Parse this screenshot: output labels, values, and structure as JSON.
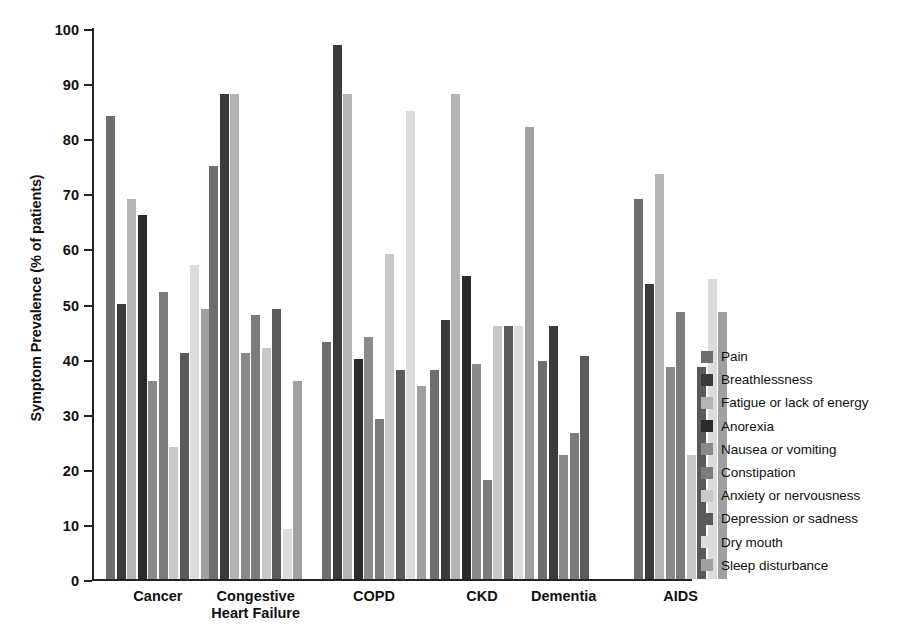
{
  "chart_data": {
    "type": "bar",
    "title": "",
    "xlabel": "",
    "ylabel": "Symptom Prevalence (% of patients)",
    "ylim": [
      0,
      100
    ],
    "yticks": [
      0,
      10,
      20,
      30,
      40,
      50,
      60,
      70,
      80,
      90,
      100
    ],
    "grid": false,
    "legend_position": "right",
    "categories": [
      "Cancer",
      "Congestive\nHeart Failure",
      "COPD",
      "CKD",
      "Dementia",
      "AIDS"
    ],
    "series": [
      {
        "name": "Pain",
        "color": "#6e6e6e",
        "values": [
          84,
          75,
          43,
          38,
          39.5,
          69
        ]
      },
      {
        "name": "Breathlessness",
        "color": "#3b3b3b",
        "values": [
          50,
          88,
          97,
          47,
          46,
          53.5
        ]
      },
      {
        "name": "Fatigue or lack of energy",
        "color": "#b4b4b4",
        "values": [
          69,
          88,
          88,
          88,
          null,
          73.5
        ]
      },
      {
        "name": "Anorexia",
        "color": "#2a2a2a",
        "values": [
          66,
          null,
          40,
          55,
          null,
          null
        ]
      },
      {
        "name": "Nausea or vomiting",
        "color": "#8a8a8a",
        "values": [
          36,
          41,
          44,
          39,
          22.5,
          38.5
        ]
      },
      {
        "name": "Constipation",
        "color": "#7c7c7c",
        "values": [
          52,
          48,
          29,
          18,
          26.5,
          48.5
        ]
      },
      {
        "name": "Anxiety or nervousness",
        "color": "#c8c8c8",
        "values": [
          24,
          42,
          59,
          46,
          null,
          22.5
        ]
      },
      {
        "name": "Depression or sadness",
        "color": "#5a5a5a",
        "values": [
          41,
          49,
          38,
          46,
          40.5,
          38.5
        ]
      },
      {
        "name": "Dry mouth",
        "color": "#dcdcdc",
        "values": [
          57,
          9,
          85,
          46,
          null,
          54.5
        ]
      },
      {
        "name": "Sleep disturbance",
        "color": "#a0a0a0",
        "values": [
          49,
          36,
          35,
          82,
          null,
          48.5
        ]
      }
    ]
  },
  "axis": {
    "tick_labels": [
      "0",
      "10",
      "20",
      "30",
      "40",
      "50",
      "60",
      "70",
      "80",
      "90",
      "100"
    ],
    "y_title": "Symptom Prevalence (% of patients)"
  },
  "groups": [
    {
      "label": "Cancer"
    },
    {
      "label": "Congestive\nHeart Failure"
    },
    {
      "label": "COPD"
    },
    {
      "label": "CKD"
    },
    {
      "label": "Dementia"
    },
    {
      "label": "AIDS"
    }
  ],
  "legend": {
    "items": [
      {
        "label": "Pain",
        "color": "#6e6e6e"
      },
      {
        "label": "Breathlessness",
        "color": "#3b3b3b"
      },
      {
        "label": "Fatigue or lack of energy",
        "color": "#b4b4b4"
      },
      {
        "label": "Anorexia",
        "color": "#2a2a2a"
      },
      {
        "label": "Nausea or vomiting",
        "color": "#8a8a8a"
      },
      {
        "label": "Constipation",
        "color": "#7c7c7c"
      },
      {
        "label": "Anxiety or nervousness",
        "color": "#c8c8c8"
      },
      {
        "label": "Depression or sadness",
        "color": "#5a5a5a"
      },
      {
        "label": "Dry mouth",
        "color": "#dcdcdc"
      },
      {
        "label": "Sleep disturbance",
        "color": "#a0a0a0"
      }
    ]
  }
}
